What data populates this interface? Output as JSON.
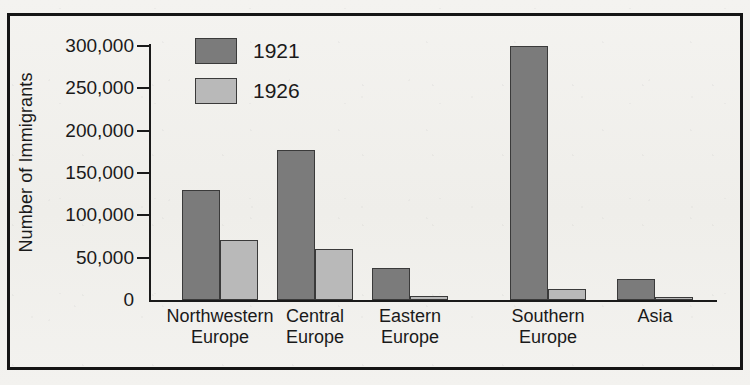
{
  "chart_data": {
    "type": "bar",
    "title": "",
    "xlabel": "",
    "ylabel": "Number of Immigrants",
    "ylim": [
      0,
      300000
    ],
    "ytick_labels": [
      "300,000",
      "250,000",
      "200,000",
      "150,000",
      "100,000",
      "50,000",
      "0"
    ],
    "ytick_values": [
      300000,
      250000,
      200000,
      150000,
      100000,
      50000,
      0
    ],
    "grid": false,
    "legend_position": "top-left-inside",
    "categories": [
      "Northwestern Europe",
      "Central Europe",
      "Eastern Europe",
      "Southern Europe",
      "Asia"
    ],
    "category_lines": [
      [
        "Northwestern",
        "Europe"
      ],
      [
        "Central",
        "Europe"
      ],
      [
        "Eastern",
        "Europe"
      ],
      [
        "Southern",
        "Europe"
      ],
      [
        "Asia",
        ""
      ]
    ],
    "series": [
      {
        "name": "1921",
        "color": "#7b7b7b",
        "values": [
          130000,
          177000,
          38000,
          300000,
          25000
        ]
      },
      {
        "name": "1926",
        "color": "#b9b9b9",
        "values": [
          71000,
          60000,
          5000,
          13000,
          3000
        ]
      }
    ]
  },
  "legend": {
    "items": [
      {
        "label": "1921",
        "color": "#7b7b7b"
      },
      {
        "label": "1926",
        "color": "#b9b9b9"
      }
    ]
  },
  "axis": {
    "y_title": "Number of Immigrants"
  },
  "colors": {
    "series_1921": "#7b7b7b",
    "series_1926": "#b9b9b9",
    "frame": "#151515",
    "text": "#1a1a1a",
    "background": "#f2f1ee"
  }
}
